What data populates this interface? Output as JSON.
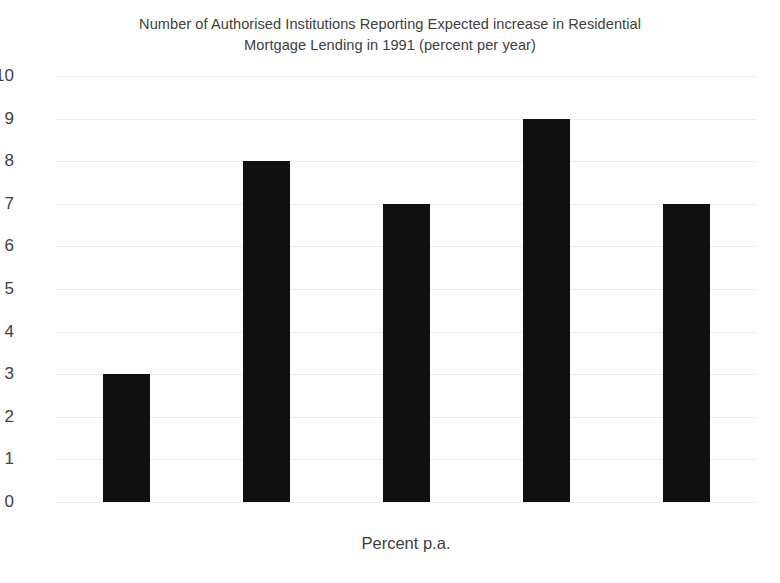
{
  "chart_data": {
    "type": "bar",
    "title": "Number of Authorised Institutions Reporting Expected increase in Residential Mortgage Lending in 1991 (percent per year)",
    "title_lines": [
      "Number of Authorised Institutions Reporting Expected increase in Residential",
      "Mortgage Lending in 1991 (percent per year)"
    ],
    "categories": [
      "0-10",
      "11-20",
      "21-30",
      "31-40",
      "Over 40"
    ],
    "values": [
      3,
      8,
      7,
      9,
      7
    ],
    "xlabel": "Percent p.a.",
    "ylabel": "",
    "ylim": [
      0,
      10
    ],
    "ytick_labels": [
      "10",
      "9",
      "8",
      "7",
      "6",
      "5",
      "4",
      "3",
      "2",
      "1",
      "0"
    ],
    "ytick_values": [
      10,
      9,
      8,
      7,
      6,
      5,
      4,
      3,
      2,
      1,
      0
    ],
    "grid": true,
    "grid_axis": "y",
    "legend": false,
    "bar_color": "#101010",
    "gridline_color": "#ececec",
    "text_color": "#404040",
    "background_color": "#ffffff"
  }
}
